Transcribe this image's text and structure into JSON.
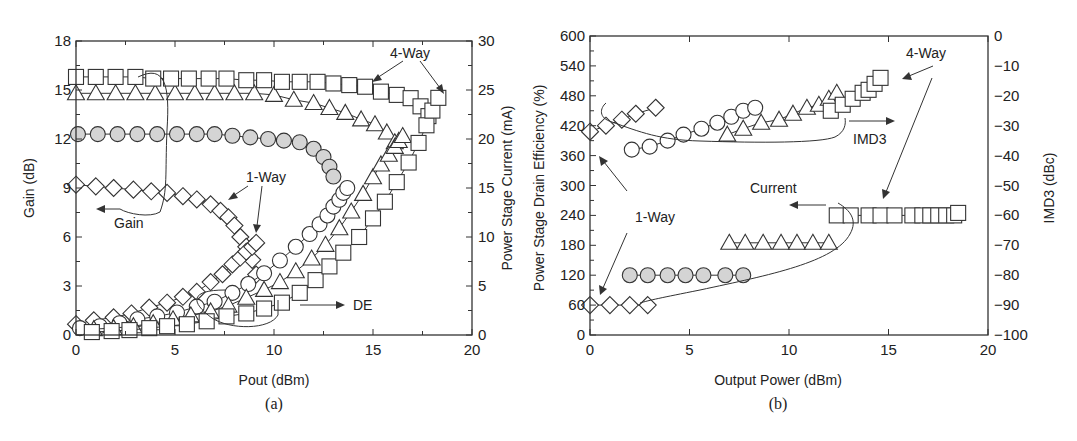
{
  "chart_data": [
    {
      "panel": "a",
      "caption": "(a)",
      "type": "scatter",
      "xlabel": "Pout (dBm)",
      "ylabel_left": "Gain (dB)",
      "ylabel_right": "Power Stage Current (mA)",
      "xlim": [
        0,
        20
      ],
      "ylim_left": [
        0,
        18
      ],
      "ylim_right": [
        0,
        30
      ],
      "x_ticks": [
        "0",
        "5",
        "10",
        "15",
        "20"
      ],
      "y_left_ticks": [
        "0",
        "3",
        "6",
        "9",
        "12",
        "15",
        "18"
      ],
      "y_right_ticks": [
        "0",
        "5",
        "10",
        "15",
        "20",
        "25",
        "30"
      ],
      "annotations": [
        "4-Way",
        "1-Way",
        "Gain",
        "DE"
      ],
      "series": [
        {
          "name": "Gain - 1-Way (diamond)",
          "axis": "left",
          "marker": "diamond",
          "x": [
            0.0,
            1.0,
            1.9,
            2.9,
            3.8,
            4.6,
            5.4,
            6.1,
            6.8,
            7.3,
            7.7,
            8.0,
            8.3,
            8.6,
            8.9,
            9.1
          ],
          "y": [
            9.2,
            9.1,
            9.0,
            8.9,
            8.8,
            8.7,
            8.5,
            8.3,
            8.0,
            7.6,
            7.2,
            6.7,
            6.0,
            5.4,
            4.6,
            3.7
          ]
        },
        {
          "name": "Gain - (shaded circle)",
          "axis": "left",
          "marker": "circle-filled",
          "x": [
            0.1,
            1.1,
            2.1,
            3.1,
            4.1,
            5.1,
            6.1,
            7.0,
            7.9,
            8.8,
            9.7,
            10.5,
            11.3,
            12.0,
            12.5,
            12.8,
            13.0
          ],
          "y": [
            12.3,
            12.3,
            12.3,
            12.3,
            12.3,
            12.3,
            12.3,
            12.3,
            12.2,
            12.1,
            12.0,
            11.9,
            11.8,
            11.4,
            10.9,
            10.3,
            9.7
          ]
        },
        {
          "name": "Gain - (triangle)",
          "axis": "left",
          "marker": "triangle",
          "x": [
            0.0,
            1.0,
            2.0,
            3.0,
            4.0,
            5.0,
            6.0,
            7.0,
            8.0,
            9.0,
            10.0,
            11.0,
            12.0,
            12.8,
            13.6,
            14.4,
            15.1,
            15.7,
            16.1
          ],
          "y": [
            14.8,
            14.8,
            14.8,
            14.8,
            14.8,
            14.8,
            14.8,
            14.8,
            14.8,
            14.8,
            14.7,
            14.4,
            14.2,
            13.9,
            13.6,
            13.2,
            12.9,
            12.4,
            11.8
          ]
        },
        {
          "name": "Gain - 4-Way (square)",
          "axis": "left",
          "marker": "square",
          "x": [
            0.0,
            1.0,
            2.0,
            3.0,
            3.9,
            4.8,
            5.7,
            6.7,
            7.6,
            8.6,
            9.5,
            10.4,
            11.3,
            12.2,
            13.0,
            13.8,
            14.6,
            15.4,
            16.2,
            16.9,
            17.4,
            17.8
          ],
          "y": [
            15.8,
            15.8,
            15.8,
            15.8,
            15.7,
            15.7,
            15.7,
            15.7,
            15.7,
            15.6,
            15.6,
            15.5,
            15.5,
            15.5,
            15.4,
            15.3,
            15.2,
            14.9,
            14.7,
            14.5,
            14.0,
            13.4
          ]
        },
        {
          "name": "DE - 1-Way (diamond)",
          "axis": "right",
          "marker": "diamond",
          "x": [
            0.0,
            0.9,
            1.9,
            2.8,
            3.7,
            4.6,
            5.4,
            6.1,
            6.8,
            7.4,
            7.9,
            8.3,
            8.6,
            8.9,
            9.1
          ],
          "y": [
            1.1,
            1.5,
            1.8,
            2.2,
            2.8,
            3.3,
            3.9,
            4.4,
            5.4,
            6.2,
            7.2,
            7.9,
            8.5,
            9.0,
            9.4
          ]
        },
        {
          "name": "DE - (circle)",
          "axis": "right",
          "marker": "circle",
          "x": [
            0.2,
            1.2,
            2.2,
            3.1,
            4.1,
            5.1,
            6.1,
            7.0,
            7.9,
            8.7,
            9.5,
            10.3,
            11.1,
            11.8,
            12.3,
            12.7,
            13.0,
            13.3,
            13.5,
            13.7
          ],
          "y": [
            0.7,
            0.9,
            1.2,
            1.6,
            1.9,
            2.3,
            2.9,
            3.4,
            4.3,
            5.2,
            6.3,
            7.6,
            9.0,
            10.3,
            11.3,
            12.2,
            13.1,
            13.8,
            14.5,
            15.0
          ]
        },
        {
          "name": "DE - (triangle)",
          "axis": "right",
          "marker": "triangle",
          "x": [
            0.9,
            1.9,
            2.9,
            3.9,
            4.9,
            5.8,
            6.8,
            7.7,
            8.6,
            9.5,
            10.3,
            11.1,
            11.9,
            12.6,
            13.3,
            13.9,
            14.5,
            15.0,
            15.4,
            15.8,
            16.1,
            16.3,
            16.5
          ],
          "y": [
            0.6,
            0.7,
            0.9,
            1.2,
            1.6,
            2.0,
            2.4,
            3.0,
            3.8,
            4.6,
            5.4,
            6.5,
            7.8,
            9.2,
            10.9,
            12.6,
            14.4,
            16.1,
            17.4,
            18.4,
            19.2,
            19.8,
            20.3
          ]
        },
        {
          "name": "DE - 4-Way (square)",
          "axis": "right",
          "marker": "square",
          "x": [
            0.8,
            1.8,
            2.7,
            3.7,
            4.6,
            5.6,
            6.6,
            7.6,
            8.6,
            9.5,
            10.4,
            11.3,
            12.1,
            12.8,
            13.5,
            14.3,
            15.0,
            15.6,
            16.2,
            16.8,
            17.3,
            17.7,
            18.0,
            18.3
          ],
          "y": [
            0.3,
            0.4,
            0.5,
            0.7,
            0.9,
            1.1,
            1.4,
            1.9,
            2.2,
            2.7,
            3.3,
            4.3,
            5.6,
            7.0,
            8.4,
            10.0,
            11.9,
            13.6,
            15.6,
            17.6,
            19.6,
            21.4,
            22.9,
            24.2
          ]
        }
      ]
    },
    {
      "panel": "b",
      "caption": "(b)",
      "type": "scatter",
      "xlabel": "Output Power (dBm)",
      "ylabel_left": "Power Stage Drain Efficiency (%)",
      "ylabel_right": "IMD3 (dBc)",
      "xlim": [
        0,
        20
      ],
      "ylim_left": [
        0,
        600
      ],
      "ylim_right": [
        -100,
        0
      ],
      "x_ticks": [
        "0",
        "5",
        "10",
        "15",
        "20"
      ],
      "y_left_ticks": [
        "0",
        "60",
        "120",
        "180",
        "240",
        "300",
        "360",
        "420",
        "480",
        "540",
        "600"
      ],
      "y_right_ticks": [
        "-100",
        "-90",
        "-80",
        "-70",
        "-60",
        "-50",
        "-40",
        "-30",
        "-20",
        "-10",
        "0"
      ],
      "annotations": [
        "4-Way",
        "IMD3",
        "Current",
        "1-Way"
      ],
      "series": [
        {
          "name": "IMD3 - 1-Way (diamond)",
          "axis": "right",
          "marker": "diamond",
          "x": [
            0.0,
            0.8,
            1.6,
            2.3,
            3.3
          ],
          "y": [
            -32,
            -30,
            -28,
            -26,
            -24
          ]
        },
        {
          "name": "IMD3 - (circle)",
          "axis": "right",
          "marker": "circle",
          "x": [
            2.1,
            3.0,
            3.9,
            4.7,
            5.6,
            6.4,
            7.1,
            7.7,
            8.3
          ],
          "y": [
            -38,
            -37,
            -35,
            -33,
            -31,
            -29,
            -27,
            -25,
            -24
          ]
        },
        {
          "name": "IMD3 - (triangle)",
          "axis": "right",
          "marker": "triangle",
          "x": [
            6.9,
            7.7,
            8.6,
            9.5,
            10.2,
            10.9,
            11.5,
            12.0,
            12.4
          ],
          "y": [
            -33,
            -31,
            -29,
            -28,
            -26,
            -24,
            -23,
            -21,
            -19
          ]
        },
        {
          "name": "IMD3 - 4-Way (square)",
          "axis": "right",
          "marker": "square",
          "x": [
            12.1,
            12.7,
            13.2,
            13.7,
            14.0,
            14.3,
            14.6
          ],
          "y": [
            -25,
            -23,
            -21,
            -19,
            -18,
            -16,
            -14
          ]
        },
        {
          "name": "Current - 1-Way (diamond)",
          "axis": "left",
          "marker": "diamond",
          "x": [
            0.0,
            1.0,
            2.0,
            2.9
          ],
          "y": [
            60,
            60,
            60,
            60
          ]
        },
        {
          "name": "Current - (shaded circle)",
          "axis": "left",
          "marker": "circle-filled",
          "x": [
            2.0,
            2.9,
            3.9,
            4.8,
            5.7,
            6.8,
            7.7
          ],
          "y": [
            120,
            120,
            120,
            120,
            120,
            120,
            120
          ]
        },
        {
          "name": "Current - (triangle)",
          "axis": "left",
          "marker": "triangle",
          "x": [
            7.0,
            7.8,
            8.7,
            9.6,
            10.4,
            11.2,
            12.0
          ],
          "y": [
            185,
            185,
            185,
            185,
            185,
            185,
            185
          ]
        },
        {
          "name": "Current - 4-Way (square)",
          "axis": "left",
          "marker": "square",
          "x": [
            12.4,
            13.1,
            14.0,
            14.6,
            15.3,
            16.2,
            16.7,
            17.1,
            17.5,
            17.9,
            18.3,
            18.5
          ],
          "y": [
            240,
            240,
            240,
            240,
            240,
            240,
            240,
            240,
            240,
            240,
            240,
            245
          ]
        }
      ]
    }
  ],
  "labels": {
    "a_xlabel": "Pout (dBm)",
    "a_ylabel_left": "Gain (dB)",
    "a_ylabel_right": "Power Stage Current (mA)",
    "a_caption": "(a)",
    "a_4way": "4-Way",
    "a_1way": "1-Way",
    "a_gain": "Gain",
    "a_de": "DE",
    "b_xlabel": "Output Power (dBm)",
    "b_ylabel_left": "Power Stage Drain Efficiency (%)",
    "b_ylabel_right": "IMD3 (dBc)",
    "b_caption": "(b)",
    "b_4way": "4-Way",
    "b_imd3": "IMD3",
    "b_current": "Current",
    "b_1way": "1-Way"
  }
}
